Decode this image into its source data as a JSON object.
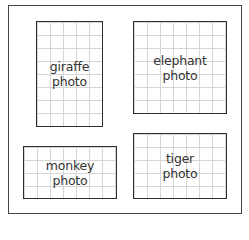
{
  "layout": {
    "outer": {
      "left": 8,
      "top": 5,
      "width": 234,
      "height": 209
    }
  },
  "frames": [
    {
      "id": "giraffe",
      "line1": "giraffe",
      "line2": "photo",
      "left": 36,
      "top": 21,
      "width": 67,
      "height": 106
    },
    {
      "id": "elephant",
      "line1": "elephant",
      "line2": "photo",
      "left": 133,
      "top": 21,
      "width": 94,
      "height": 93
    },
    {
      "id": "monkey",
      "line1": "monkey",
      "line2": "photo",
      "left": 23,
      "top": 146,
      "width": 94,
      "height": 53
    },
    {
      "id": "tiger",
      "line1": "tiger",
      "line2": "photo",
      "left": 133,
      "top": 133,
      "width": 94,
      "height": 66
    }
  ],
  "colors": {
    "border": "#2e2e2e",
    "grid": "#d6d6d6",
    "text": "#333333"
  }
}
